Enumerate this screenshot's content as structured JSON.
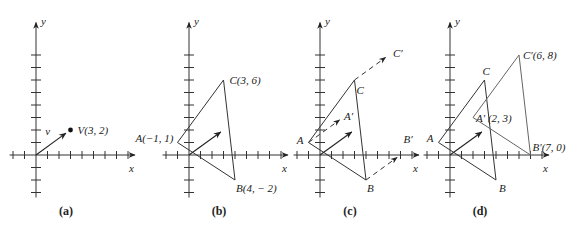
{
  "figure": {
    "scale": {
      "sx": 11.5,
      "sy": 12.5
    },
    "panels": [
      {
        "id": "a",
        "caption": "(a)",
        "origin": [
          36,
          155
        ],
        "x_label": "x",
        "y_label": "y",
        "vector_label": "v",
        "point": {
          "label": "V(3, 2)",
          "x": 3,
          "y": 2
        }
      },
      {
        "id": "b",
        "caption": "(b)",
        "origin": [
          189,
          155
        ],
        "x_label": "x",
        "y_label": "y",
        "vertices": [
          {
            "name": "A",
            "label": "A(−1, 1)",
            "x": -1,
            "y": 1
          },
          {
            "name": "B",
            "label": "B(4, − 2)",
            "x": 4,
            "y": -2
          },
          {
            "name": "C",
            "label": "C(3, 6)",
            "x": 3,
            "y": 6
          }
        ],
        "vector": {
          "x": 3,
          "y": 2
        }
      },
      {
        "id": "c",
        "caption": "(c)",
        "origin": [
          320,
          155
        ],
        "x_label": "x",
        "y_label": "y",
        "vertices": [
          {
            "name": "A",
            "label": "A",
            "x": -1,
            "y": 1
          },
          {
            "name": "B",
            "label": "B",
            "x": 4,
            "y": -2
          },
          {
            "name": "C",
            "label": "C",
            "x": 3,
            "y": 6
          }
        ],
        "translated_labels": {
          "A": "A′",
          "B": "B′",
          "C": "C′"
        },
        "vector": {
          "x": 3,
          "y": 2
        }
      },
      {
        "id": "d",
        "caption": "(d)",
        "origin": [
          450,
          155
        ],
        "x_label": "x",
        "y_label": "y",
        "vertices": [
          {
            "name": "A",
            "label": "A",
            "x": -1,
            "y": 1
          },
          {
            "name": "B",
            "label": "B",
            "x": 4,
            "y": -2
          },
          {
            "name": "C",
            "label": "C",
            "x": 3,
            "y": 6
          }
        ],
        "translated": [
          {
            "name": "A'",
            "label": "A′ (2, 3)",
            "x": 2,
            "y": 3
          },
          {
            "name": "B'",
            "label": "B′(7, 0)",
            "x": 7,
            "y": 0
          },
          {
            "name": "C'",
            "label": "C′(6, 8)",
            "x": 6,
            "y": 8
          }
        ],
        "vector": {
          "x": 3,
          "y": 2
        }
      }
    ]
  }
}
